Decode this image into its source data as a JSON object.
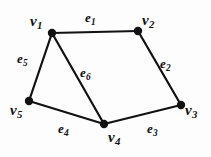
{
  "figure": {
    "kind": "undirected-graph-diagram",
    "background_color": "#fdfdfd",
    "stroke_color": "#111111",
    "width": 211,
    "height": 157
  },
  "vertices": [
    {
      "id": "v1",
      "base": "v",
      "sub": "1",
      "x": 52,
      "y": 33,
      "r": 4.2,
      "label_x": 30,
      "label_y": 14
    },
    {
      "id": "v2",
      "base": "v",
      "sub": "2",
      "x": 138,
      "y": 31,
      "r": 4.2,
      "label_x": 142,
      "label_y": 13
    },
    {
      "id": "v3",
      "base": "v",
      "sub": "3",
      "x": 181,
      "y": 105,
      "r": 4.2,
      "label_x": 185,
      "label_y": 103
    },
    {
      "id": "v4",
      "base": "v",
      "sub": "4",
      "x": 104,
      "y": 124,
      "r": 4.2,
      "label_x": 108,
      "label_y": 130
    },
    {
      "id": "v5",
      "base": "v",
      "sub": "5",
      "x": 29,
      "y": 101,
      "r": 4.2,
      "label_x": 10,
      "label_y": 103
    }
  ],
  "edges": [
    {
      "id": "e1",
      "base": "e",
      "sub": "1",
      "from": "v1",
      "to": "v2",
      "label_x": 85,
      "label_y": 11
    },
    {
      "id": "e2",
      "base": "e",
      "sub": "2",
      "from": "v2",
      "to": "v3",
      "label_x": 160,
      "label_y": 57
    },
    {
      "id": "e3",
      "base": "e",
      "sub": "3",
      "from": "v4",
      "to": "v3",
      "label_x": 147,
      "label_y": 122
    },
    {
      "id": "e4",
      "base": "e",
      "sub": "4",
      "from": "v5",
      "to": "v4",
      "label_x": 58,
      "label_y": 122
    },
    {
      "id": "e5",
      "base": "e",
      "sub": "5",
      "from": "v1",
      "to": "v5",
      "label_x": 17,
      "label_y": 52
    },
    {
      "id": "e6",
      "base": "e",
      "sub": "6",
      "from": "v1",
      "to": "v4",
      "label_x": 80,
      "label_y": 66
    }
  ]
}
